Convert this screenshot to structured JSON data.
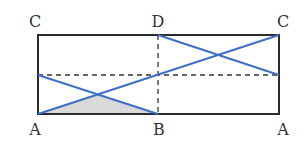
{
  "diagram": {
    "type": "geometry-unfolded-rectangle",
    "labels": {
      "top_left": "C",
      "top_mid": "D",
      "top_right": "C",
      "bottom_left": "A",
      "bottom_mid": "B",
      "bottom_right": "A"
    },
    "colors": {
      "border": "#2b2b2b",
      "dashed": "#333333",
      "blue_line": "#3d6fc6",
      "shade": "#d9d9d9"
    },
    "rectangle": {
      "x1": 38,
      "y1": 35,
      "x2": 279,
      "y2": 114
    },
    "dashed_lines": [
      {
        "name": "horizontal-midline",
        "x1": 38,
        "y1": 75,
        "x2": 279,
        "y2": 75
      },
      {
        "name": "vertical-midline",
        "x1": 158,
        "y1": 35,
        "x2": 158,
        "y2": 114
      }
    ],
    "blue_lines": [
      {
        "name": "diagonal-a-to-c",
        "x1": 38,
        "y1": 114,
        "x2": 279,
        "y2": 35
      },
      {
        "name": "segment-left",
        "x1": 38,
        "y1": 75,
        "x2": 158,
        "y2": 114
      },
      {
        "name": "segment-right",
        "x1": 158,
        "y1": 35,
        "x2": 279,
        "y2": 75
      }
    ],
    "shaded_triangle": {
      "points": "38,114 98,95 158,114"
    }
  }
}
